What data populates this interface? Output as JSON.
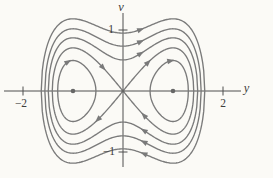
{
  "figure": {
    "bg": "#fbfaf6",
    "curve_color": "#7a7a7a",
    "axis_color": "#4f4f4f",
    "dot_color": "#666666",
    "text_color": "#3c3c3c"
  },
  "chart_data": {
    "type": "line",
    "subtype": "phase-portrait",
    "xlabel": "y",
    "ylabel": "v",
    "xlim": [
      -2.4,
      2.47
    ],
    "ylim": [
      -1.33,
      1.33
    ],
    "grid": false,
    "x_ticks": [
      {
        "value": -2,
        "label": "−2"
      },
      {
        "value": 2,
        "label": "2"
      }
    ],
    "y_ticks": [
      {
        "value": 1,
        "label": "1"
      },
      {
        "value": -1,
        "label": "−1"
      }
    ],
    "model": "y' = v, v' = y - y^3 ; energy E = v^2/2 - y^2/2 + y^4/4 ; curves are level sets v^2 = 2E + y^2 - y^4/2",
    "orbits": {
      "outer_energies": [
        0.45,
        0.27,
        0.13
      ],
      "separatrix_energy": 0,
      "inner_lobe_energy": -0.125
    },
    "equilibria": {
      "centers": [
        [
          -1,
          0
        ],
        [
          1,
          0
        ]
      ],
      "saddle": [
        0,
        0
      ]
    },
    "flow_direction": "clockwise",
    "arrows": [
      {
        "E": 0.45,
        "y": 0.35,
        "branch": "top"
      },
      {
        "E": 0.27,
        "y": 0.35,
        "branch": "top"
      },
      {
        "E": 0.13,
        "y": 0.35,
        "branch": "top"
      },
      {
        "E": 0.45,
        "y": 0.42,
        "branch": "bottom"
      },
      {
        "E": 0.27,
        "y": 0.42,
        "branch": "bottom"
      },
      {
        "E": 0.13,
        "y": 0.42,
        "branch": "bottom"
      },
      {
        "E": 0,
        "y": -0.4,
        "branch": "top"
      },
      {
        "E": 0,
        "y": 0.5,
        "branch": "top"
      },
      {
        "E": 0,
        "y": -0.5,
        "branch": "bottom"
      },
      {
        "E": 0,
        "y": 0.42,
        "branch": "bottom"
      },
      {
        "E": -0.125,
        "y": -1.1,
        "branch": "top"
      },
      {
        "E": -0.125,
        "y": 0.95,
        "branch": "top"
      }
    ],
    "layout": {
      "canvas": [
        273,
        178
      ],
      "origin_px": [
        123,
        91
      ],
      "px_per_unit": [
        50,
        61
      ],
      "x_axis_px": [
        4,
        241
      ],
      "v_axis_px": [
        13,
        167
      ]
    }
  }
}
